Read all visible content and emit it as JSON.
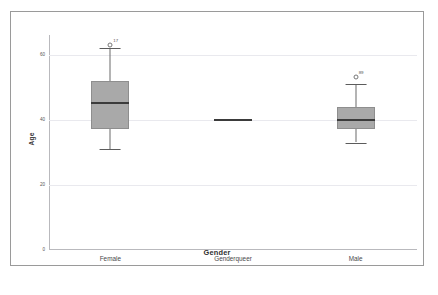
{
  "chart_data": {
    "type": "box",
    "title": "",
    "xlabel": "Gender",
    "ylabel": "Age",
    "ylim": [
      0,
      66
    ],
    "yticks": [
      0,
      20,
      40,
      60
    ],
    "ytick_labels": [
      "0",
      "20",
      "40",
      "60"
    ],
    "grid": true,
    "legend": "none",
    "categories": [
      "Female",
      "Genderqueer",
      "Male"
    ],
    "boxes": [
      {
        "category": "Female",
        "whisker_low": 31,
        "q1": 37,
        "median": 45,
        "q3": 52,
        "whisker_high": 62,
        "outliers": [
          {
            "value": 63,
            "label": "17"
          }
        ]
      },
      {
        "category": "Genderqueer",
        "whisker_low": 40,
        "q1": 40,
        "median": 40,
        "q3": 40,
        "whisker_high": 40,
        "outliers": []
      },
      {
        "category": "Male",
        "whisker_low": 33,
        "q1": 37,
        "median": 40,
        "q3": 44,
        "whisker_high": 51,
        "outliers": [
          {
            "value": 53,
            "label": "89"
          }
        ]
      }
    ],
    "colors": {
      "box_fill": "#a9a9a9",
      "box_border": "#8e8e8e",
      "median": "#3b3b3b",
      "whisker": "#6b6b6b",
      "grid": "#e9e9ee",
      "axis": "#b9b9bd",
      "frame": "#9a9a9a",
      "text": "#3a3a3a"
    }
  },
  "caption": ""
}
